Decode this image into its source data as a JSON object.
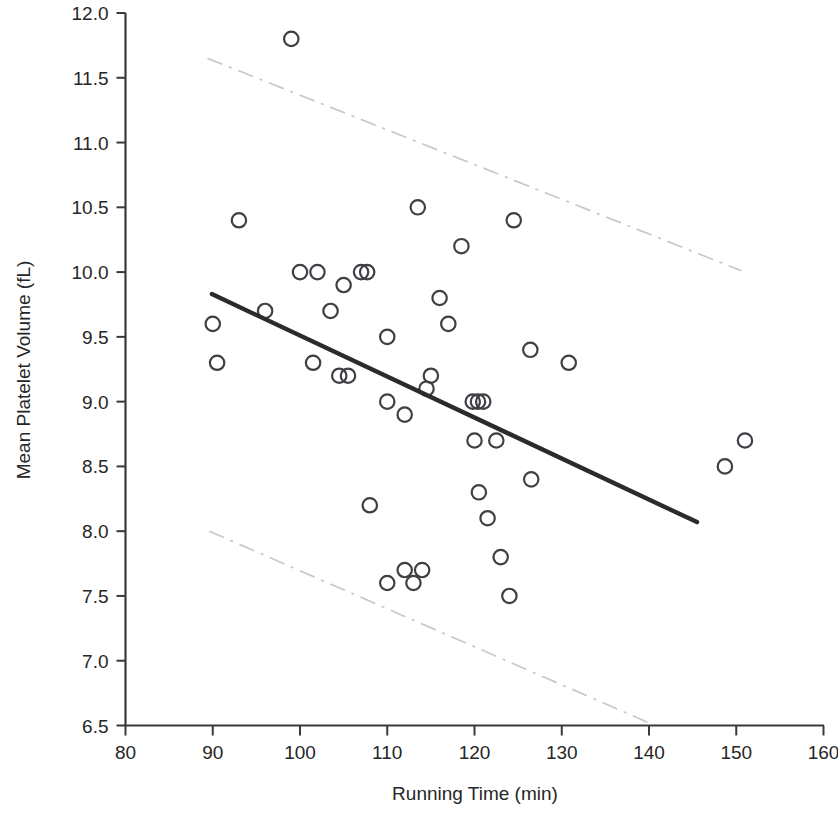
{
  "chart_data": {
    "type": "scatter",
    "title": "",
    "subtitle": "",
    "xlabel": "Running Time (min)",
    "ylabel": "Mean Platelet Volume (fL)",
    "xlim": [
      80,
      160
    ],
    "ylim": [
      6.5,
      12.0
    ],
    "xticks": [
      80,
      90,
      100,
      110,
      120,
      130,
      140,
      150,
      160
    ],
    "xtick_labels": [
      "80",
      "90",
      "100",
      "110",
      "120",
      "130",
      "140",
      "150",
      "160"
    ],
    "yticks": [
      6.5,
      7.0,
      7.5,
      8.0,
      8.5,
      9.0,
      9.5,
      10.0,
      10.5,
      11.0,
      11.5,
      12.0
    ],
    "ytick_labels": [
      "6.5",
      "7.0",
      "7.5",
      "8.0",
      "8.5",
      "9.0",
      "9.5",
      "10.0",
      "10.5",
      "11.0",
      "11.5",
      "12.0"
    ],
    "grid": false,
    "legend": "none",
    "marker_style": "open-circle",
    "series": [
      {
        "name": "Observations",
        "marker": "open-circle",
        "color": "#3f3f46",
        "points": [
          [
            90.0,
            9.6
          ],
          [
            90.5,
            9.3
          ],
          [
            93.0,
            10.4
          ],
          [
            96.0,
            9.7
          ],
          [
            99.0,
            11.8
          ],
          [
            100.0,
            10.0
          ],
          [
            102.0,
            10.0
          ],
          [
            101.5,
            9.3
          ],
          [
            103.5,
            9.7
          ],
          [
            104.5,
            9.2
          ],
          [
            105.5,
            9.2
          ],
          [
            105.0,
            9.9
          ],
          [
            107.0,
            10.0
          ],
          [
            107.7,
            10.0
          ],
          [
            108.0,
            8.2
          ],
          [
            110.0,
            9.5
          ],
          [
            110.0,
            9.0
          ],
          [
            110.0,
            7.6
          ],
          [
            112.0,
            8.9
          ],
          [
            112.0,
            7.7
          ],
          [
            113.0,
            7.6
          ],
          [
            113.5,
            10.5
          ],
          [
            114.0,
            7.7
          ],
          [
            114.5,
            9.1
          ],
          [
            115.0,
            9.2
          ],
          [
            116.0,
            9.8
          ],
          [
            117.0,
            9.6
          ],
          [
            118.5,
            10.2
          ],
          [
            119.8,
            9.0
          ],
          [
            120.4,
            9.0
          ],
          [
            121.0,
            9.0
          ],
          [
            120.0,
            8.7
          ],
          [
            120.5,
            8.3
          ],
          [
            121.5,
            8.1
          ],
          [
            122.5,
            8.7
          ],
          [
            123.0,
            7.8
          ],
          [
            124.0,
            7.5
          ],
          [
            124.5,
            10.4
          ],
          [
            126.5,
            8.4
          ],
          [
            126.4,
            9.4
          ],
          [
            130.8,
            9.3
          ],
          [
            148.7,
            8.5
          ],
          [
            151.0,
            8.7
          ]
        ]
      }
    ],
    "fit_line": {
      "name": "Linear regression fit",
      "color": "#2b2b2b",
      "x_start": 89.9,
      "y_start": 9.83,
      "x_end": 145.5,
      "y_end": 8.07
    },
    "confidence_bands": [
      {
        "name": "upper-confidence-band",
        "color": "#c8c8c8",
        "style": "dash-dot",
        "x_start": 89.4,
        "y_start": 11.65,
        "x_end": 150.6,
        "y_end": 10.01
      },
      {
        "name": "lower-confidence-band",
        "color": "#c8c8c8",
        "style": "dash-dot",
        "x_start": 89.6,
        "y_start": 8.0,
        "x_end": 140.7,
        "y_end": 6.5
      }
    ]
  }
}
